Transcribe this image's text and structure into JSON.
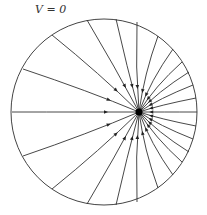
{
  "label": "V = 0",
  "diagram": {
    "type": "field lines of point charge inside grounded conducting sphere",
    "boundary": {
      "cx": 104,
      "cy": 112,
      "r": 93
    },
    "charge": {
      "x": 139,
      "y": 112
    },
    "endpoints": [
      [
        52,
        35
      ],
      [
        87,
        20
      ],
      [
        116,
        19
      ],
      [
        137,
        22
      ],
      [
        158,
        36
      ],
      [
        173,
        49
      ],
      [
        182,
        62
      ],
      [
        189,
        72
      ],
      [
        193,
        85
      ],
      [
        196,
        98
      ],
      [
        197,
        112
      ],
      [
        196,
        126
      ],
      [
        193,
        139
      ],
      [
        189,
        152
      ],
      [
        182,
        162
      ],
      [
        173,
        175
      ],
      [
        158,
        188
      ],
      [
        137,
        202
      ],
      [
        116,
        205
      ],
      [
        87,
        204
      ],
      [
        52,
        189
      ],
      [
        23,
        156
      ],
      [
        12,
        112
      ],
      [
        23,
        69
      ]
    ]
  }
}
